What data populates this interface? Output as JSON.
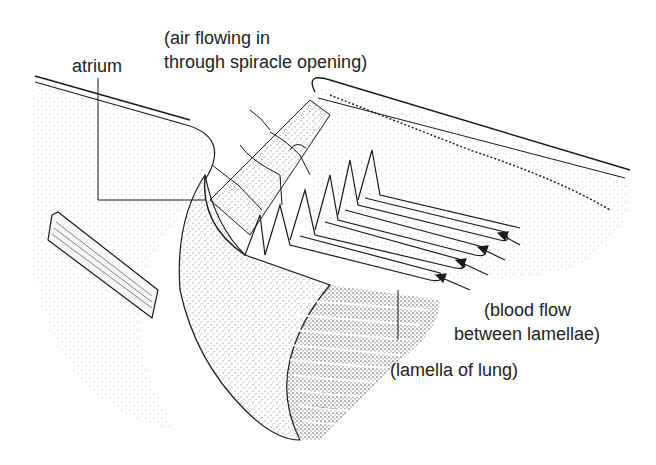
{
  "diagram": {
    "labels": {
      "atrium": "atrium",
      "air_line1": "(air flowing in",
      "air_line2": "through spiracle opening)",
      "blood_line1": "(blood flow",
      "blood_line2": "between lamellae)",
      "lamella": "(lamella of lung)"
    },
    "colors": {
      "ink": "#1a1a1a",
      "stipple": "#555555",
      "background": "#ffffff"
    }
  }
}
